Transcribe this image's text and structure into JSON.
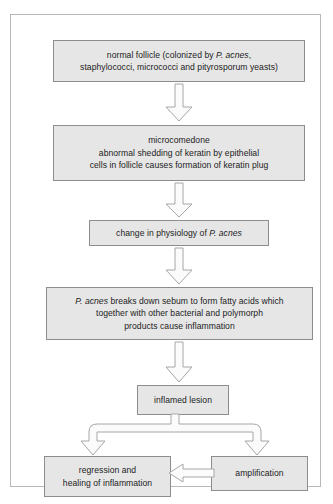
{
  "diagram": {
    "colors": {
      "node_fill": "#e6e6e6",
      "node_border": "#8d8d8d",
      "arrow_fill": "#fbfbfb",
      "arrow_border": "#a6a6a6",
      "frame_border": "#b9b9b9",
      "background": "#ffffff",
      "text": "#1c1c1c"
    },
    "nodes": [
      {
        "id": "normal-follicle",
        "text": "normal follicle (colonized by P. acnes,\nstaphylococci, micrococci and pityrosporum yeasts)",
        "italic_terms": [
          "P. acnes"
        ]
      },
      {
        "id": "microcomedone",
        "text": "microcomedone\nabnormal shedding of keratin by epithelial\ncells in follicle causes formation of keratin plug",
        "italic_terms": []
      },
      {
        "id": "physiology",
        "text": "change in physiology of P. acnes",
        "italic_terms": [
          "P. acnes"
        ]
      },
      {
        "id": "fatty-acids",
        "text": "P. acnes breaks down sebum to form fatty acids which\ntogether with other bacterial and polymorph\nproducts cause inflammation",
        "italic_terms": [
          "P. acnes"
        ]
      },
      {
        "id": "inflamed-lesion",
        "text": "inflamed lesion",
        "italic_terms": []
      },
      {
        "id": "regression",
        "text": "regression and\nhealing of inflammation",
        "italic_terms": []
      },
      {
        "id": "amplification",
        "text": "amplification",
        "italic_terms": []
      }
    ],
    "connectors": [
      {
        "id": "arrow-1",
        "from": "normal-follicle",
        "to": "microcomedone",
        "direction": "down",
        "style": "block-outline"
      },
      {
        "id": "arrow-2",
        "from": "microcomedone",
        "to": "physiology",
        "direction": "down",
        "style": "block-outline"
      },
      {
        "id": "arrow-3",
        "from": "physiology",
        "to": "fatty-acids",
        "direction": "down",
        "style": "block-outline"
      },
      {
        "id": "arrow-4",
        "from": "fatty-acids",
        "to": "inflamed-lesion",
        "direction": "down",
        "style": "block-outline"
      },
      {
        "id": "arrow-split",
        "from": "inflamed-lesion",
        "to": "regression, amplification",
        "direction": "down-split",
        "style": "block-outline"
      },
      {
        "id": "arrow-feedback",
        "from": "amplification",
        "to": "regression",
        "direction": "left",
        "style": "block-outline"
      }
    ]
  }
}
